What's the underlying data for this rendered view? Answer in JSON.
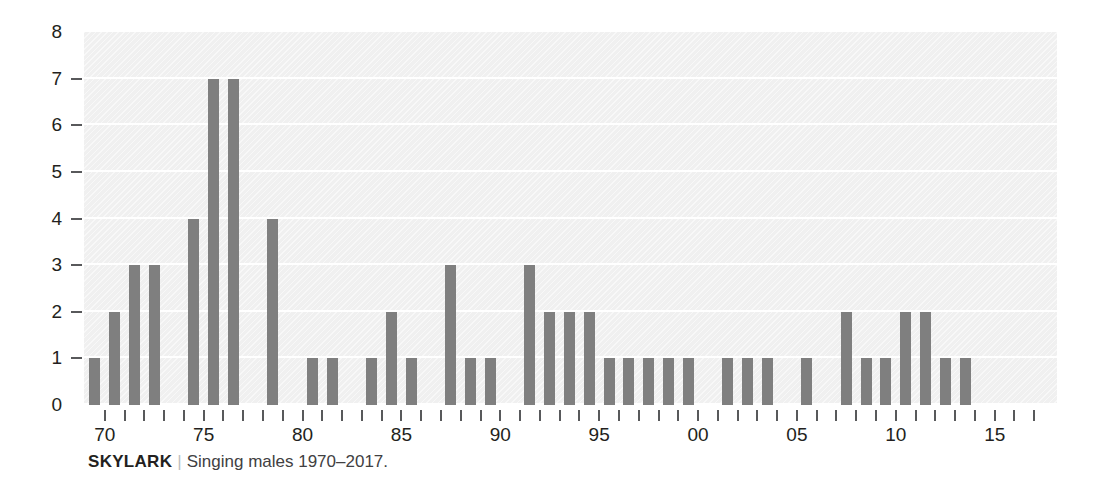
{
  "caption": {
    "title": "SKYLARK",
    "separator": "|",
    "text": "Singing males 1970–2017."
  },
  "chart_data": {
    "type": "bar",
    "title": "SKYLARK",
    "subtitle": "Singing males 1970–2017.",
    "xlabel": "",
    "ylabel": "",
    "ylim": [
      0,
      8
    ],
    "yticks": [
      0,
      1,
      2,
      3,
      4,
      5,
      6,
      7,
      8
    ],
    "ytick_labels": [
      "0",
      "1",
      "2",
      "3",
      "4",
      "5",
      "6",
      "7",
      "8"
    ],
    "grid": true,
    "legend": "none",
    "xtick_labels": [
      "70",
      "75",
      "80",
      "85",
      "90",
      "95",
      "00",
      "05",
      "10",
      "15"
    ],
    "xtick_years": [
      1970,
      1975,
      1980,
      1985,
      1990,
      1995,
      2000,
      2005,
      2010,
      2015
    ],
    "categories": [
      1970,
      1971,
      1972,
      1973,
      1974,
      1975,
      1976,
      1977,
      1978,
      1979,
      1980,
      1981,
      1982,
      1983,
      1984,
      1985,
      1986,
      1987,
      1988,
      1989,
      1990,
      1991,
      1992,
      1993,
      1994,
      1995,
      1996,
      1997,
      1998,
      1999,
      2000,
      2001,
      2002,
      2003,
      2004,
      2005,
      2006,
      2007,
      2008,
      2009,
      2010,
      2011,
      2012,
      2013,
      2014,
      2015,
      2016,
      2017
    ],
    "values": [
      1,
      2,
      3,
      3,
      0,
      4,
      7,
      7,
      0,
      4,
      0,
      1,
      1,
      0,
      1,
      2,
      1,
      0,
      3,
      1,
      1,
      0,
      3,
      2,
      2,
      2,
      1,
      1,
      1,
      1,
      1,
      0,
      1,
      1,
      1,
      0,
      1,
      0,
      2,
      1,
      1,
      2,
      2,
      1,
      1,
      0,
      0,
      0
    ],
    "bar_color": "#7f7f7f",
    "plot_background": "#f0f0f0",
    "gridline_color": "#ffffff"
  }
}
